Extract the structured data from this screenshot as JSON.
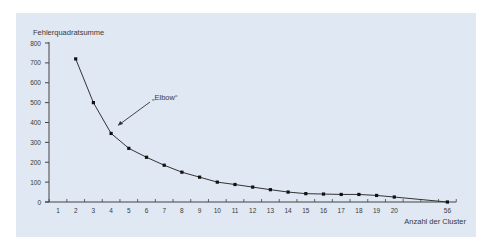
{
  "chart_data": {
    "type": "line",
    "title": "",
    "ylabel": "Fehlerquadratsumme",
    "xlabel": "Anzahl der Cluster",
    "ylim": [
      0,
      800
    ],
    "yticks": [
      0,
      100,
      200,
      300,
      400,
      500,
      600,
      700,
      800
    ],
    "xtick_labels": [
      "1",
      "2",
      "3",
      "4",
      "5",
      "6",
      "7",
      "8",
      "9",
      "10",
      "11",
      "12",
      "13",
      "14",
      "15",
      "16",
      "17",
      "18",
      "19",
      "20",
      "",
      "",
      "56"
    ],
    "grid": false,
    "legend": null,
    "annotations": [
      {
        "text": "„Elbow“",
        "points_to": {
          "x": 4,
          "y": 345
        }
      }
    ],
    "series": [
      {
        "name": "Fehlerquadratsumme",
        "x": [
          2,
          3,
          4,
          5,
          6,
          7,
          8,
          9,
          10,
          11,
          12,
          13,
          14,
          15,
          16,
          17,
          18,
          19,
          20,
          56
        ],
        "values": [
          720,
          500,
          345,
          270,
          225,
          185,
          150,
          125,
          100,
          88,
          75,
          62,
          50,
          42,
          40,
          38,
          38,
          33,
          25,
          0
        ]
      }
    ]
  },
  "colors": {
    "panel_background": "#dfe8f3",
    "line": "#333333",
    "axis": "#444444",
    "text": "#3a3a3a"
  }
}
